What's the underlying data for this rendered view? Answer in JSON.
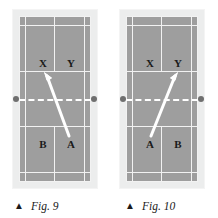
{
  "page": {
    "background_color": "#ffffff",
    "width": 218,
    "height": 218,
    "kind": "badminton-court-diagram-pair"
  },
  "palette": {
    "court_surface": "#9e9e9e",
    "court_frame": "#eceded",
    "court_line": "#f2f2f2",
    "net_line": "#ffffff",
    "net_post": "#6f6f6f",
    "arrow": "#ffffff",
    "label_text": "#1a1a1a",
    "caption_text": "#1a1a1a"
  },
  "figures": [
    {
      "id": "fig-9",
      "caption": {
        "marker": "▲",
        "text": "Fig. 9"
      },
      "court": {
        "net_label": "net",
        "posts": [
          "left",
          "right"
        ]
      },
      "players": [
        {
          "name": "X",
          "position": "upper-left",
          "x": 24,
          "y": 47
        },
        {
          "name": "Y",
          "position": "upper-right",
          "x": 52,
          "y": 47
        },
        {
          "name": "B",
          "position": "lower-left",
          "x": 24,
          "y": 128
        },
        {
          "name": "A",
          "position": "lower-right",
          "x": 52,
          "y": 128
        }
      ],
      "shot": {
        "from": "A",
        "to": "X",
        "direction": "up-left",
        "start": {
          "x": 50,
          "y": 120
        },
        "end": {
          "x": 25,
          "y": 56
        }
      }
    },
    {
      "id": "fig-10",
      "caption": {
        "marker": "▲",
        "text": "Fig. 10"
      },
      "court": {
        "net_label": "net",
        "posts": [
          "left",
          "right"
        ]
      },
      "players": [
        {
          "name": "X",
          "position": "upper-left",
          "x": 24,
          "y": 47
        },
        {
          "name": "Y",
          "position": "upper-right",
          "x": 52,
          "y": 47
        },
        {
          "name": "A",
          "position": "lower-left",
          "x": 24,
          "y": 128
        },
        {
          "name": "B",
          "position": "lower-right",
          "x": 52,
          "y": 128
        }
      ],
      "shot": {
        "from": "A",
        "to": "Y",
        "direction": "up-right",
        "start": {
          "x": 25,
          "y": 120
        },
        "end": {
          "x": 52,
          "y": 56
        }
      }
    }
  ]
}
